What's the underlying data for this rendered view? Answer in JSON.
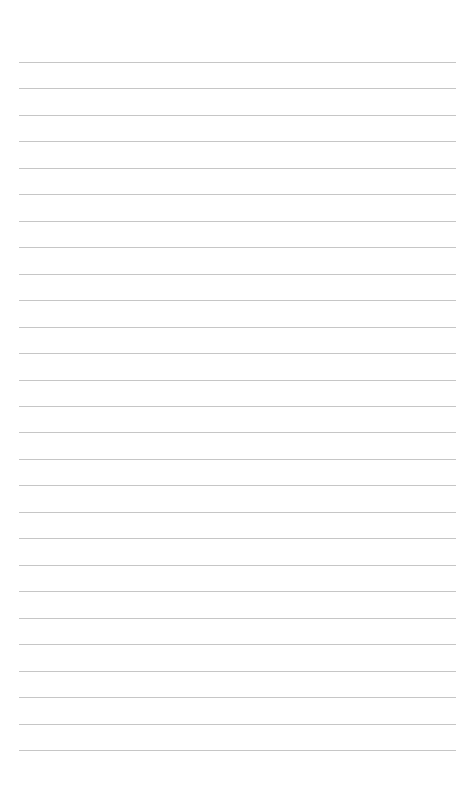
{
  "page": {
    "type": "lined-paper",
    "background_color": "#ffffff",
    "line_color": "#c6c6c6",
    "line_count": 27,
    "first_line_y": 62,
    "line_spacing": 26.46,
    "line_left": 19,
    "line_right": 456
  }
}
